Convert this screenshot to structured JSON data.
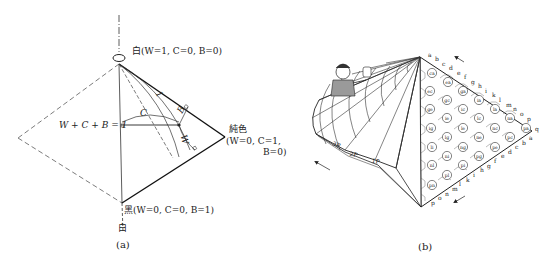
{
  "figure_a": {
    "caption": "(a)",
    "top_vertex_label": "白(W=1,  C=0,  B=0)",
    "right_vertex_label_1": "純色",
    "right_vertex_label_2": "(W=0,  C=1,",
    "right_vertex_label_3": "B=0)",
    "bottom_vertex_label": "黑(W=0,  C=0,  B=1)",
    "axis_bottom_label": "白",
    "sum_label": "W + C + B = 1",
    "var_c": "C",
    "var_b": "B",
    "var_w": "W",
    "var_l": "1"
  },
  "figure_b": {
    "caption": "(b)",
    "page_labels": [
      "3P",
      "2P",
      "1P"
    ],
    "upper_edge_letters": [
      "a",
      "b",
      "c",
      "d",
      "e",
      "f",
      "g",
      "h",
      "i",
      "k",
      "l",
      "m",
      "n",
      "o",
      "p"
    ],
    "right_vertex_letter": "q",
    "lower_edge_letters": [
      "a",
      "b",
      "c",
      "d",
      "e",
      "f",
      "g",
      "h",
      "i",
      "k",
      "l",
      "m",
      "n",
      "o",
      "p"
    ],
    "hex_cells": [
      {
        "label": "ca",
        "x": 432,
        "y": 73
      },
      {
        "label": "ea",
        "x": 448,
        "y": 82
      },
      {
        "label": "ec",
        "x": 430,
        "y": 91
      },
      {
        "label": "ga",
        "x": 463,
        "y": 91
      },
      {
        "label": "gc",
        "x": 447,
        "y": 100
      },
      {
        "label": "ia",
        "x": 479,
        "y": 100
      },
      {
        "label": "ge",
        "x": 430,
        "y": 109
      },
      {
        "label": "ic",
        "x": 463,
        "y": 109
      },
      {
        "label": "la",
        "x": 495,
        "y": 109
      },
      {
        "label": "ie",
        "x": 447,
        "y": 118
      },
      {
        "label": "lc",
        "x": 479,
        "y": 118
      },
      {
        "label": "na",
        "x": 510,
        "y": 118
      },
      {
        "label": "ig",
        "x": 431,
        "y": 128
      },
      {
        "label": "le",
        "x": 463,
        "y": 128
      },
      {
        "label": "nc",
        "x": 495,
        "y": 128
      },
      {
        "label": "pa",
        "x": 526,
        "y": 128
      },
      {
        "label": "lg",
        "x": 447,
        "y": 137
      },
      {
        "label": "ne",
        "x": 479,
        "y": 137
      },
      {
        "label": "pc",
        "x": 510,
        "y": 137
      },
      {
        "label": "li",
        "x": 432,
        "y": 147
      },
      {
        "label": "ng",
        "x": 463,
        "y": 147
      },
      {
        "label": "pe",
        "x": 495,
        "y": 147
      },
      {
        "label": "ni",
        "x": 447,
        "y": 156
      },
      {
        "label": "pg",
        "x": 479,
        "y": 156
      },
      {
        "label": "nl",
        "x": 432,
        "y": 165
      },
      {
        "label": "pi",
        "x": 463,
        "y": 165
      },
      {
        "label": "pl",
        "x": 447,
        "y": 175
      },
      {
        "label": "pn",
        "x": 432,
        "y": 185
      }
    ]
  }
}
